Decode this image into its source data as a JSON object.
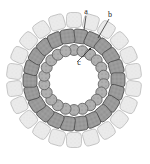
{
  "figure": {
    "kind": "schematic-diagram",
    "background_color": "#ffffff",
    "center": {
      "x": 74,
      "y": 80
    },
    "labels": [
      {
        "id": "label-a",
        "text": "a",
        "x": 86,
        "y": 14,
        "leader": {
          "x1": 86,
          "y1": 16,
          "x2": 84,
          "y2": 30
        },
        "refers_to": "outer-ring"
      },
      {
        "id": "label-b",
        "text": "b",
        "x": 110,
        "y": 17,
        "leader": {
          "x1": 109,
          "y1": 19,
          "x2": 98,
          "y2": 38
        },
        "refers_to": "middle-ring"
      },
      {
        "id": "label-c",
        "text": "c",
        "x": 79,
        "y": 65,
        "leader": {
          "x1": 77,
          "y1": 62,
          "x2": 91,
          "y2": 48
        },
        "arrow": true,
        "refers_to": "inner-ring"
      }
    ],
    "rings": [
      {
        "id": "outer-ring",
        "name": "outer-ring",
        "shape": "rounded-square",
        "count": 22,
        "radius": 60,
        "size": 15,
        "corner_radius": 4,
        "fill_color": "#ebebeb",
        "stroke_color": "#bdbdbd",
        "angle_offset": 0,
        "texture": "light-speckle"
      },
      {
        "id": "middle-ring",
        "name": "middle-ring",
        "shape": "rounded-square",
        "count": 22,
        "radius": 44,
        "size": 14,
        "corner_radius": 3,
        "fill_color": "#9a9a9a",
        "stroke_color": "#4d4d4d",
        "angle_offset": 8,
        "texture": "dark-speckle"
      },
      {
        "id": "inner-ring",
        "name": "inner-ring",
        "shape": "circle",
        "count": 22,
        "radius": 30,
        "size": 11,
        "fill_color": "#b0b0b0",
        "stroke_color": "#5a5a5a",
        "angle_offset": 0,
        "texture": "dot-pattern"
      }
    ],
    "hollow_core": {
      "radius": 22,
      "fill_color": "#ffffff"
    }
  }
}
